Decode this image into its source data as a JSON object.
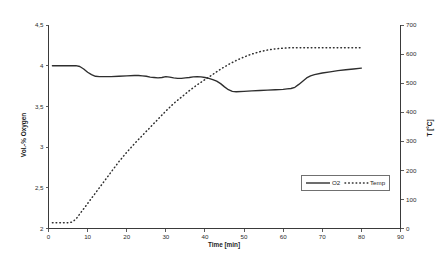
{
  "chart_data": {
    "type": "line",
    "title": "",
    "subtitle": "",
    "xlabel": "Time [min]",
    "ylabel": "Vol.-% Oxygen",
    "y2label": "T [°C]",
    "grid": false,
    "legend_position": "inside-right-lower",
    "xlim": [
      0,
      90
    ],
    "ylim": [
      2,
      4.5
    ],
    "y2lim": [
      0,
      700
    ],
    "xticks": [
      0,
      10,
      20,
      30,
      40,
      50,
      60,
      70,
      80,
      90
    ],
    "xtick_labels": [
      "0",
      "10",
      "20",
      "30",
      "40",
      "50",
      "60",
      "70",
      "80",
      "90"
    ],
    "yticks": [
      2,
      2.5,
      3,
      3.5,
      4,
      4.5
    ],
    "ytick_labels": [
      "2",
      "2,5",
      "3",
      "3,5",
      "4",
      "4,5"
    ],
    "y2ticks": [
      0,
      100,
      200,
      300,
      400,
      500,
      600,
      700
    ],
    "y2tick_labels": [
      "0",
      "100",
      "200",
      "300",
      "400",
      "500",
      "600",
      "700"
    ],
    "series": [
      {
        "name": "O2",
        "axis": "left",
        "style": "solid",
        "color": "#2e2e2e",
        "x": [
          1,
          3,
          5,
          7,
          8,
          9,
          10,
          11,
          12,
          13,
          14,
          16,
          18,
          20,
          22,
          23,
          24,
          25,
          26,
          27,
          28,
          29,
          30,
          31,
          32,
          33,
          34,
          35,
          36,
          37,
          38,
          39,
          40,
          41,
          42,
          43,
          44,
          45,
          46,
          47,
          48,
          50,
          52,
          54,
          56,
          58,
          60,
          61,
          62,
          63,
          64,
          65,
          66,
          67,
          68,
          70,
          72,
          74,
          76,
          78,
          80
        ],
        "y": [
          4.0,
          4.0,
          4.0,
          4.0,
          3.99,
          3.96,
          3.92,
          3.89,
          3.87,
          3.865,
          3.865,
          3.865,
          3.87,
          3.875,
          3.88,
          3.88,
          3.875,
          3.87,
          3.86,
          3.855,
          3.85,
          3.855,
          3.865,
          3.86,
          3.85,
          3.845,
          3.845,
          3.85,
          3.855,
          3.862,
          3.865,
          3.862,
          3.855,
          3.845,
          3.83,
          3.81,
          3.78,
          3.74,
          3.705,
          3.685,
          3.68,
          3.685,
          3.69,
          3.695,
          3.7,
          3.705,
          3.71,
          3.715,
          3.72,
          3.735,
          3.77,
          3.81,
          3.85,
          3.875,
          3.89,
          3.91,
          3.925,
          3.94,
          3.95,
          3.96,
          3.97
        ]
      },
      {
        "name": "Temp",
        "axis": "right",
        "style": "dotted",
        "color": "#2e2e2e",
        "x": [
          1,
          2,
          3,
          4,
          5,
          6,
          7,
          8,
          9,
          10,
          12,
          14,
          16,
          18,
          20,
          22,
          24,
          26,
          28,
          30,
          32,
          34,
          36,
          38,
          40,
          42,
          44,
          46,
          48,
          50,
          52,
          54,
          56,
          57,
          58,
          59,
          60,
          61,
          62,
          63,
          64,
          66,
          68,
          70,
          72,
          74,
          76,
          78,
          80
        ],
        "y": [
          20,
          20,
          20,
          20,
          20,
          22,
          32,
          50,
          68,
          86,
          122,
          158,
          194,
          230,
          262,
          292,
          320,
          348,
          376,
          404,
          430,
          452,
          474,
          494,
          512,
          530,
          548,
          564,
          578,
          590,
          600,
          608,
          614,
          616,
          618,
          619,
          620,
          621,
          622,
          622,
          622,
          622,
          622,
          622,
          622,
          622,
          622,
          622,
          622
        ]
      }
    ],
    "annotations": []
  },
  "legend": {
    "entries": [
      {
        "label": "O2",
        "style": "solid"
      },
      {
        "label": "Temp",
        "style": "dotted"
      }
    ]
  },
  "axes": {
    "left_title": "Vol.-% Oxygen",
    "right_title": "T [°C]",
    "bottom_title": "Time [min]"
  }
}
